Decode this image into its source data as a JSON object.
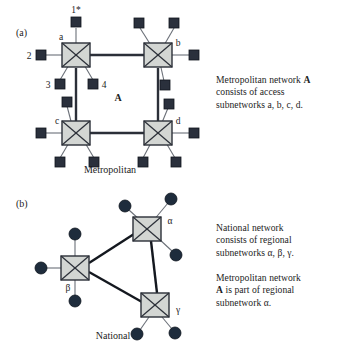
{
  "figure": {
    "background_color": "#ffffff",
    "panels": [
      {
        "id": "a",
        "label": "(a)",
        "caption": "Metropolitan",
        "center_label": "A",
        "node_label_color": "#1d1d1d",
        "switch_fill": "#d3d6d3",
        "switch_stroke": "#2b2f38",
        "leaf_fill": "#2a303c",
        "leaf_shape": "square",
        "backbone_color": "#2b2f38",
        "access_link_color": "#5a5f66",
        "switches": [
          {
            "name": "a",
            "label": "a",
            "x": 76,
            "y": 55
          },
          {
            "name": "b",
            "label": "b",
            "x": 158,
            "y": 55
          },
          {
            "name": "c",
            "label": "c",
            "x": 76,
            "y": 133
          },
          {
            "name": "d",
            "label": "d",
            "x": 158,
            "y": 133
          }
        ],
        "numbered_leaves": [
          {
            "label": "1*",
            "x": 76,
            "y": 22
          },
          {
            "label": "2",
            "x": 42,
            "y": 55
          },
          {
            "label": "3",
            "x": 57,
            "y": 82
          },
          {
            "label": "4",
            "x": 95,
            "y": 82
          }
        ],
        "backbone_links": [
          {
            "from": "a",
            "to": "b"
          },
          {
            "from": "a",
            "to": "c"
          },
          {
            "from": "b",
            "to": "d"
          },
          {
            "from": "c",
            "to": "d"
          }
        ]
      },
      {
        "id": "b",
        "label": "(b)",
        "caption": "National",
        "switch_fill": "#d3d6d3",
        "switch_stroke": "#2b2f38",
        "leaf_fill": "#1e2c3c",
        "leaf_shape": "circle",
        "backbone_color": "#14181f",
        "access_link_color": "#5a5f66",
        "switches": [
          {
            "name": "alpha",
            "label": "α",
            "x": 147,
            "y": 229
          },
          {
            "name": "beta",
            "label": "β",
            "x": 75,
            "y": 268
          },
          {
            "name": "gamma",
            "label": "γ",
            "x": 155,
            "y": 305
          }
        ],
        "backbone_links": [
          {
            "from": "alpha",
            "to": "beta"
          },
          {
            "from": "beta",
            "to": "gamma"
          },
          {
            "from": "alpha",
            "to": "gamma"
          }
        ]
      }
    ]
  },
  "annotations": {
    "metropolitan": {
      "line1_prefix": "Metropolitan network ",
      "line1_bold": "A",
      "line2": "consists of access",
      "line3": "subnetworks a, b, c, d."
    },
    "national": {
      "line1": "National network",
      "line2": "consists of regional",
      "line3": "subnetworks α, β, γ."
    },
    "metropolitan_regional": {
      "line1": "Metropolitan network",
      "line2_bold": "A",
      "line2_rest": " is part of regional",
      "line3": "subnetwork α."
    }
  }
}
